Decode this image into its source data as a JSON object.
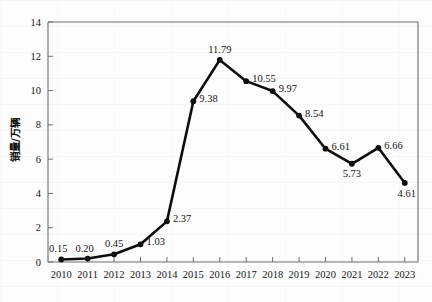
{
  "chart_data": {
    "type": "line",
    "title": "",
    "xlabel": "",
    "ylabel": "销量/万辆",
    "categories": [
      "2010",
      "2011",
      "2012",
      "2013",
      "2014",
      "2015",
      "2016",
      "2017",
      "2018",
      "2019",
      "2020",
      "2021",
      "2022",
      "2023"
    ],
    "values": [
      0.15,
      0.2,
      0.45,
      1.03,
      2.37,
      9.38,
      11.79,
      10.55,
      9.97,
      8.54,
      6.61,
      5.73,
      6.66,
      4.61
    ],
    "point_labels": [
      "0.15",
      "0.20",
      "0.45",
      "1.03",
      "2.37",
      "9.38",
      "11.79",
      "10.55",
      "9.97",
      "8.54",
      "6.61",
      "5.73",
      "6.66",
      "4.61"
    ],
    "ylim": [
      0,
      14
    ],
    "ytick_labels": [
      "0",
      "2",
      "4",
      "6",
      "8",
      "10",
      "12",
      "14"
    ],
    "ytick_values": [
      0,
      2,
      4,
      6,
      8,
      10,
      12,
      14
    ],
    "grid": false,
    "legend": "none",
    "series_color": "#0d0d0d",
    "marker": "circle",
    "label_positions": [
      "above-left",
      "above-left",
      "above",
      "right",
      "right",
      "right",
      "above",
      "right",
      "right",
      "right",
      "right",
      "below",
      "right",
      "below-right"
    ]
  },
  "figure": {
    "background_color": "#fdfdfd",
    "axis_color": "#6e6e74",
    "text_color": "#151515"
  }
}
